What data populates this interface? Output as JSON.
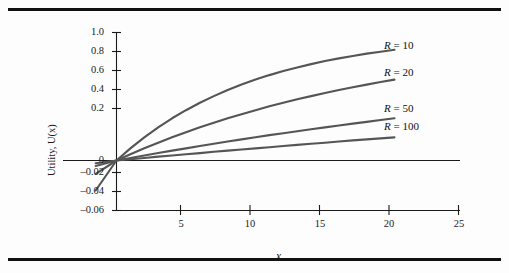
{
  "figure": {
    "background_color": "#fdfdfd",
    "rule_color": "#111111",
    "curve_color": "#555555",
    "axis_color": "#1a1a1a",
    "ylabel": "Utility, U(x)",
    "xlabel": "x"
  },
  "chart_data": {
    "type": "line",
    "title": "",
    "xlabel": "x",
    "ylabel": "Utility, U(x)",
    "xlim": [
      -1.5,
      25
    ],
    "ylim": [
      -0.06,
      1.0
    ],
    "grid": false,
    "legend_position": "right-inline",
    "note": "y-axis is broken: above 0 the ticks step by 0.2, below 0 they step by 0.02",
    "xticks": [
      5,
      10,
      15,
      20,
      25
    ],
    "xtick_labels": [
      "5",
      "10",
      "15",
      "20",
      "25"
    ],
    "yticks": [
      1.0,
      0.8,
      0.6,
      0.4,
      0.2,
      0,
      -0.02,
      -0.04,
      -0.06
    ],
    "ytick_labels": [
      "1.0",
      "0.8",
      "0.6",
      "0.4",
      "0.2",
      "0",
      "–0.02",
      "–0.04",
      "–0.06"
    ],
    "x": [
      -1.5,
      0,
      1,
      2,
      3,
      4,
      5,
      6,
      7,
      8,
      9,
      10,
      11,
      12,
      13,
      14,
      15,
      16,
      17,
      18,
      19,
      20
    ],
    "series": [
      {
        "name": "R = 10",
        "R": 10,
        "label": "R = 10",
        "label_symbol": "R",
        "label_value": "10",
        "values": [
          -0.036,
          0.0,
          0.095,
          0.181,
          0.259,
          0.33,
          0.393,
          0.451,
          0.503,
          0.551,
          0.593,
          0.632,
          0.667,
          0.699,
          0.727,
          0.753,
          0.777,
          0.798,
          0.817,
          0.835,
          0.85,
          0.865
        ]
      },
      {
        "name": "R = 20",
        "R": 20,
        "label": "R = 20",
        "label_symbol": "R",
        "label_value": "20",
        "values": [
          -0.016,
          0.0,
          0.049,
          0.095,
          0.139,
          0.181,
          0.221,
          0.259,
          0.295,
          0.33,
          0.362,
          0.393,
          0.423,
          0.451,
          0.478,
          0.503,
          0.528,
          0.551,
          0.573,
          0.593,
          0.613,
          0.632
        ]
      },
      {
        "name": "R = 50",
        "R": 50,
        "label": "R = 50",
        "label_symbol": "R",
        "label_value": "50",
        "values": [
          -0.0065,
          0.0,
          0.02,
          0.039,
          0.058,
          0.077,
          0.095,
          0.113,
          0.131,
          0.148,
          0.165,
          0.181,
          0.198,
          0.213,
          0.229,
          0.244,
          0.259,
          0.274,
          0.288,
          0.302,
          0.316,
          0.33
        ]
      },
      {
        "name": "R = 100",
        "R": 100,
        "label": "R = 100",
        "label_symbol": "R",
        "label_value": "100",
        "values": [
          -0.0032,
          0.0,
          0.01,
          0.02,
          0.03,
          0.039,
          0.049,
          0.058,
          0.068,
          0.077,
          0.086,
          0.095,
          0.104,
          0.113,
          0.122,
          0.131,
          0.139,
          0.148,
          0.157,
          0.165,
          0.173,
          0.181
        ]
      }
    ]
  },
  "legend": {
    "items": [
      {
        "symbol": "R",
        "eq": " = ",
        "value": "10",
        "full": "R = 10"
      },
      {
        "symbol": "R",
        "eq": " = ",
        "value": "20",
        "full": "R = 20"
      },
      {
        "symbol": "R",
        "eq": " = ",
        "value": "50",
        "full": "R = 50"
      },
      {
        "symbol": "R",
        "eq": " = ",
        "value": "100",
        "full": "R = 100"
      }
    ]
  },
  "axes": {
    "y_tick_labels": [
      "1.0",
      "0.8",
      "0.6",
      "0.4",
      "0.2",
      "0",
      "–0.02",
      "–0.04",
      "–0.06"
    ],
    "x_tick_labels": [
      "5",
      "10",
      "15",
      "20",
      "25"
    ]
  }
}
